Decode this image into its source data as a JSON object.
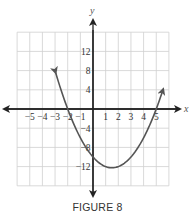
{
  "caption": "FIGURE 8",
  "chart_data": {
    "type": "line",
    "title": "",
    "caption": "FIGURE 8",
    "xlabel": "x",
    "ylabel": "y",
    "xlim": [
      -6,
      6
    ],
    "ylim": [
      -16,
      16
    ],
    "grid": true,
    "x_ticks": [
      -5,
      -4,
      -3,
      -2,
      -1,
      1,
      2,
      3,
      4,
      5
    ],
    "x_tick_labels": [
      "−5",
      "−4",
      "−3",
      "−2",
      "−1",
      "1",
      "2",
      "3",
      "4",
      "5"
    ],
    "y_ticks": [
      12,
      8,
      4,
      -4,
      -8,
      -12
    ],
    "y_tick_labels": [
      "12",
      "8",
      "4",
      "−4",
      "−8",
      "−12"
    ],
    "series": [
      {
        "name": "parabola",
        "equation": "y = x^2 - 3x - 10",
        "color": "#555555",
        "x": [
          -3.0,
          -2.5,
          -2,
          -1,
          0,
          1,
          1.5,
          2,
          3,
          4,
          5,
          5.6
        ],
        "y": [
          8,
          3.75,
          0,
          -6,
          -10,
          -12,
          -12.25,
          -12,
          -10,
          -6,
          0,
          4.56
        ],
        "arrows": "both-ends",
        "x_intercepts": [
          -2,
          5
        ],
        "y_intercept": -10,
        "vertex": [
          1.5,
          -12.25
        ]
      }
    ]
  }
}
